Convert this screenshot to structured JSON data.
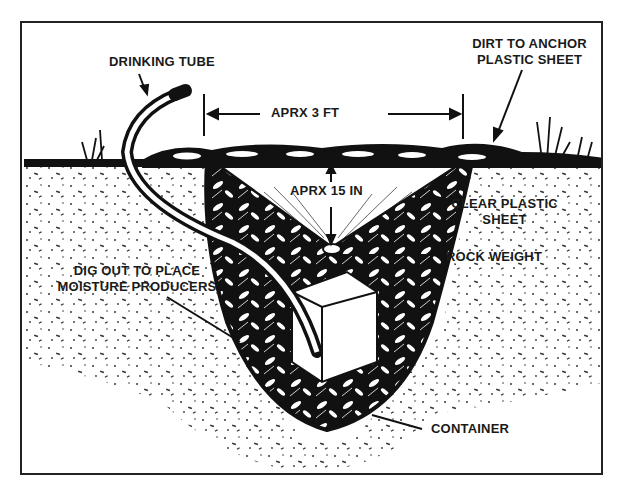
{
  "diagram": {
    "labels": {
      "drinking_tube": "DRINKING TUBE",
      "dirt_anchor_line1": "DIRT TO ANCHOR",
      "dirt_anchor_line2": "PLASTIC SHEET",
      "width_dim": "APRX 3 FT",
      "depth_dim": "APRX 15 IN",
      "clear_plastic_line1": "CLEAR PLASTIC",
      "clear_plastic_line2": "SHEET",
      "rock_weight": "ROCK WEIGHT",
      "dig_out_line1": "DIG OUT TO PLACE",
      "dig_out_line2": "MOISTURE PRODUCERS",
      "container": "CONTAINER"
    },
    "colors": {
      "ink": "#111111",
      "paper": "#ffffff",
      "frame": "#222222"
    }
  }
}
